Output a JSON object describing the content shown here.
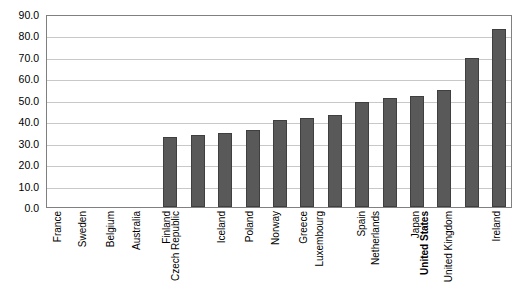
{
  "chart_data": {
    "type": "bar",
    "title": "",
    "subtitle": "",
    "xlabel": "",
    "ylabel": "",
    "ylim": [
      0.0,
      90.0
    ],
    "ytick_step": 10.0,
    "ytick_labels": [
      "90.0",
      "80.0",
      "70.0",
      "60.0",
      "50.0",
      "40.0",
      "30.0",
      "20.0",
      "10.0",
      "0.0"
    ],
    "ytick_values": [
      90.0,
      80.0,
      70.0,
      60.0,
      50.0,
      40.0,
      30.0,
      20.0,
      10.0,
      0.0
    ],
    "grid": "horizontal",
    "legend": "none",
    "categories": [
      "France",
      "Sweden",
      "Belgium",
      "Australia",
      "Finland",
      "Czech Republic",
      "Iceland",
      "Poland",
      "Norway",
      "Greece",
      "Luxembourg",
      "Spain",
      "Netherlands",
      "Japan",
      "United States",
      "United Kingdom",
      "Ireland"
    ],
    "values": [
      0.0,
      0.0,
      0.0,
      0.0,
      32.5,
      33.8,
      34.5,
      36.0,
      40.5,
      41.5,
      43.0,
      49.0,
      50.8,
      52.0,
      54.5,
      69.5,
      83.0
    ],
    "highlighted_category": "United States",
    "bar_color": "#595959",
    "bar_border_color": "#3f3f3f",
    "gridline_color": "#c8c8c8",
    "axis_color": "#808080",
    "plot_background": "#ffffff"
  }
}
